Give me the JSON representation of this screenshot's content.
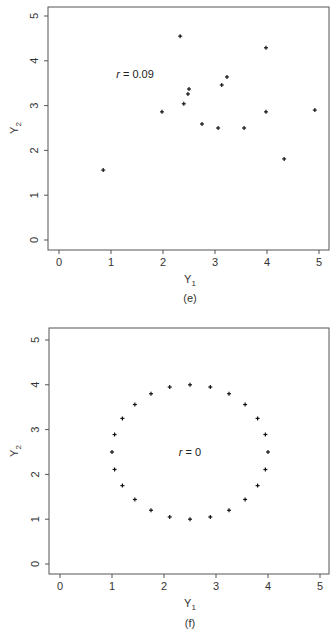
{
  "chart_data": [
    {
      "type": "scatter",
      "panel": "(e)",
      "caption": "(e)",
      "xlabel": "Y",
      "xlabel_sub": "1",
      "ylabel": "Y",
      "ylabel_sub": "2",
      "xlim": [
        -0.2,
        5.2
      ],
      "ylim": [
        -0.2,
        5.2
      ],
      "xticks": [
        0,
        1,
        2,
        3,
        4,
        5
      ],
      "yticks": [
        0,
        1,
        2,
        3,
        4,
        5
      ],
      "grid": false,
      "annotation": {
        "text_r": "r",
        "text_rest": " = 0.09",
        "x": 1.1,
        "y": 3.7
      },
      "points": [
        {
          "x": 0.85,
          "y": 1.56
        },
        {
          "x": 1.98,
          "y": 2.86
        },
        {
          "x": 2.33,
          "y": 4.55
        },
        {
          "x": 2.4,
          "y": 3.04
        },
        {
          "x": 2.48,
          "y": 3.26
        },
        {
          "x": 2.5,
          "y": 3.37
        },
        {
          "x": 2.75,
          "y": 2.59
        },
        {
          "x": 3.06,
          "y": 2.5
        },
        {
          "x": 3.13,
          "y": 3.46
        },
        {
          "x": 3.23,
          "y": 3.64
        },
        {
          "x": 3.56,
          "y": 2.5
        },
        {
          "x": 3.98,
          "y": 4.29
        },
        {
          "x": 3.98,
          "y": 2.86
        },
        {
          "x": 4.33,
          "y": 1.81
        },
        {
          "x": 4.92,
          "y": 2.9
        }
      ]
    },
    {
      "type": "scatter",
      "panel": "(f)",
      "caption": "(f)",
      "xlabel": "Y",
      "xlabel_sub": "1",
      "ylabel": "Y",
      "ylabel_sub": "2",
      "xlim": [
        -0.2,
        5.2
      ],
      "ylim": [
        -0.2,
        5.2
      ],
      "xticks": [
        0,
        1,
        2,
        3,
        4,
        5
      ],
      "yticks": [
        0,
        1,
        2,
        3,
        4,
        5
      ],
      "grid": false,
      "annotation": {
        "text_r": "r",
        "text_rest": " = 0",
        "x": 2.5,
        "y": 2.5
      },
      "shape": "circle",
      "center": [
        2.5,
        2.5
      ],
      "radius": 1.5,
      "points": [
        {
          "x": 4.0,
          "y": 2.5
        },
        {
          "x": 3.95,
          "y": 2.89
        },
        {
          "x": 3.8,
          "y": 3.25
        },
        {
          "x": 3.56,
          "y": 3.56
        },
        {
          "x": 3.25,
          "y": 3.8
        },
        {
          "x": 2.89,
          "y": 3.95
        },
        {
          "x": 2.5,
          "y": 4.0
        },
        {
          "x": 2.11,
          "y": 3.95
        },
        {
          "x": 1.75,
          "y": 3.8
        },
        {
          "x": 1.44,
          "y": 3.56
        },
        {
          "x": 1.2,
          "y": 3.25
        },
        {
          "x": 1.05,
          "y": 2.89
        },
        {
          "x": 1.0,
          "y": 2.5
        },
        {
          "x": 1.05,
          "y": 2.11
        },
        {
          "x": 1.2,
          "y": 1.75
        },
        {
          "x": 1.44,
          "y": 1.44
        },
        {
          "x": 1.75,
          "y": 1.2
        },
        {
          "x": 2.11,
          "y": 1.05
        },
        {
          "x": 2.5,
          "y": 1.0
        },
        {
          "x": 2.89,
          "y": 1.05
        },
        {
          "x": 3.25,
          "y": 1.2
        },
        {
          "x": 3.56,
          "y": 1.44
        },
        {
          "x": 3.8,
          "y": 1.75
        },
        {
          "x": 3.95,
          "y": 2.11
        }
      ]
    }
  ]
}
